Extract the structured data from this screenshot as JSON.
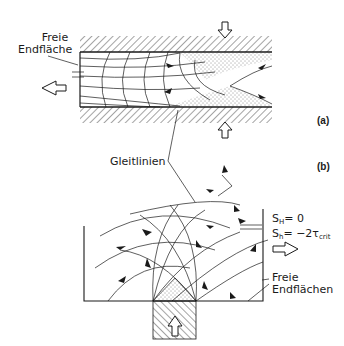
{
  "figure": {
    "panel_a": {
      "tag": "(a)",
      "label_free_face_line1": "Freie",
      "label_free_face_line2": "Endfläche"
    },
    "panel_b": {
      "tag": "(b)",
      "label_free_faces_line1": "Freie",
      "label_free_faces_line2": "Endflächen",
      "cond1_S": "S",
      "cond1_sub": "H",
      "cond1_rest": "= 0",
      "cond2_S": "S",
      "cond2_sub": "h",
      "cond2_rest": "= −2τ",
      "cond2_sub2": "crit"
    },
    "shared": {
      "label_slip_lines": "Gleitlinien"
    },
    "colors": {
      "ink": "#1a1a1a",
      "background": "#ffffff"
    }
  }
}
